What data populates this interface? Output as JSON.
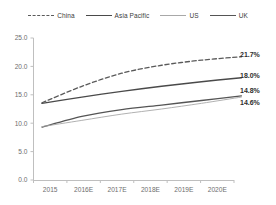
{
  "legend": {
    "position": "top-center",
    "entries": [
      {
        "label": "China",
        "style": "dashed",
        "color": "#5a5a5a",
        "width": 1.3
      },
      {
        "label": "Asia Pacific",
        "style": "solid",
        "color": "#4a4a4a",
        "width": 1.4
      },
      {
        "label": "US",
        "style": "solid",
        "color": "#a8a8a8",
        "width": 0.9
      },
      {
        "label": "UK",
        "style": "solid",
        "color": "#555555",
        "width": 1.3
      }
    ]
  },
  "chart_data": {
    "type": "line",
    "title": "",
    "xlabel": "",
    "ylabel": "",
    "x": [
      "2015",
      "2016E",
      "2017E",
      "2018E",
      "2019E",
      "2020E"
    ],
    "categories": [
      "2015",
      "2016E",
      "2017E",
      "2018E",
      "2019E",
      "2020E"
    ],
    "ylim": [
      0.0,
      25.0
    ],
    "yticks": [
      0.0,
      5.0,
      10.0,
      15.0,
      20.0,
      25.0
    ],
    "ytick_labels": [
      "0.0",
      "5.0",
      "10.0",
      "15.0",
      "20.0",
      "25.0"
    ],
    "grid": false,
    "series": [
      {
        "name": "China",
        "values": [
          13.6,
          16.5,
          18.8,
          20.2,
          21.1,
          21.7
        ],
        "end_label": "21.7%"
      },
      {
        "name": "Asia Pacific",
        "values": [
          13.5,
          14.6,
          15.6,
          16.5,
          17.3,
          18.0
        ],
        "end_label": "18.0%"
      },
      {
        "name": "UK",
        "values": [
          9.3,
          11.2,
          12.4,
          13.2,
          14.0,
          14.8
        ],
        "end_label": "14.8%"
      },
      {
        "name": "US",
        "values": [
          9.4,
          10.5,
          11.6,
          12.5,
          13.5,
          14.6
        ],
        "end_label": "14.6%"
      }
    ],
    "end_labels": [
      "21.7%",
      "18.0%",
      "14.8%",
      "14.6%"
    ]
  },
  "axes": {
    "y_axis_color": "#bfbfbf",
    "x_axis_color": "#bfbfbf",
    "tick_color": "#bfbfbf"
  }
}
